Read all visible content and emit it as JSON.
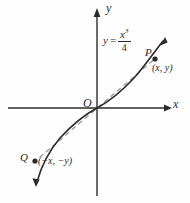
{
  "figure": {
    "name": "odd-function-symmetry-graph",
    "background_color": "#fefefe",
    "ink_color": "#2b2b2b",
    "dashed_color": "#9a9a9a"
  },
  "axes": {
    "x_label": "x",
    "y_label": "y",
    "origin_label": "O",
    "x_axis": {
      "x1": 8,
      "y1": 108,
      "x2": 172,
      "y2": 108,
      "arrow": "right"
    },
    "y_axis": {
      "x1": 97,
      "y1": 196,
      "x2": 97,
      "y2": 10,
      "arrow": "up"
    }
  },
  "equation": {
    "lhs": "y",
    "relation": "=",
    "numerator": "x",
    "numerator_exponent": "3",
    "denominator": "4",
    "plain": "y = x^3/4"
  },
  "points": [
    {
      "id": "P",
      "label": "P",
      "coords_label": "(x, y)",
      "cx": 155,
      "cy": 59
    },
    {
      "id": "Q",
      "label": "Q",
      "coords_label": "(−x, −y)",
      "cx": 35,
      "cy": 161
    }
  ],
  "curve": {
    "name": "cubic-curve",
    "description": "y = x^3/4 cubic through the origin",
    "path": "M 36,185 C 40,168 48,150 60,137 C 72,124 84,114 97,108 C 110,102 122,92 134,79 C 146,66 156,50 165,39",
    "arrow_start": "down-left",
    "arrow_end": "up-right"
  },
  "secant": {
    "name": "dashed-secant-line",
    "description": "dashed line joining Q, O and P",
    "x1": 35,
    "y1": 161,
    "x2": 156,
    "y2": 58
  }
}
